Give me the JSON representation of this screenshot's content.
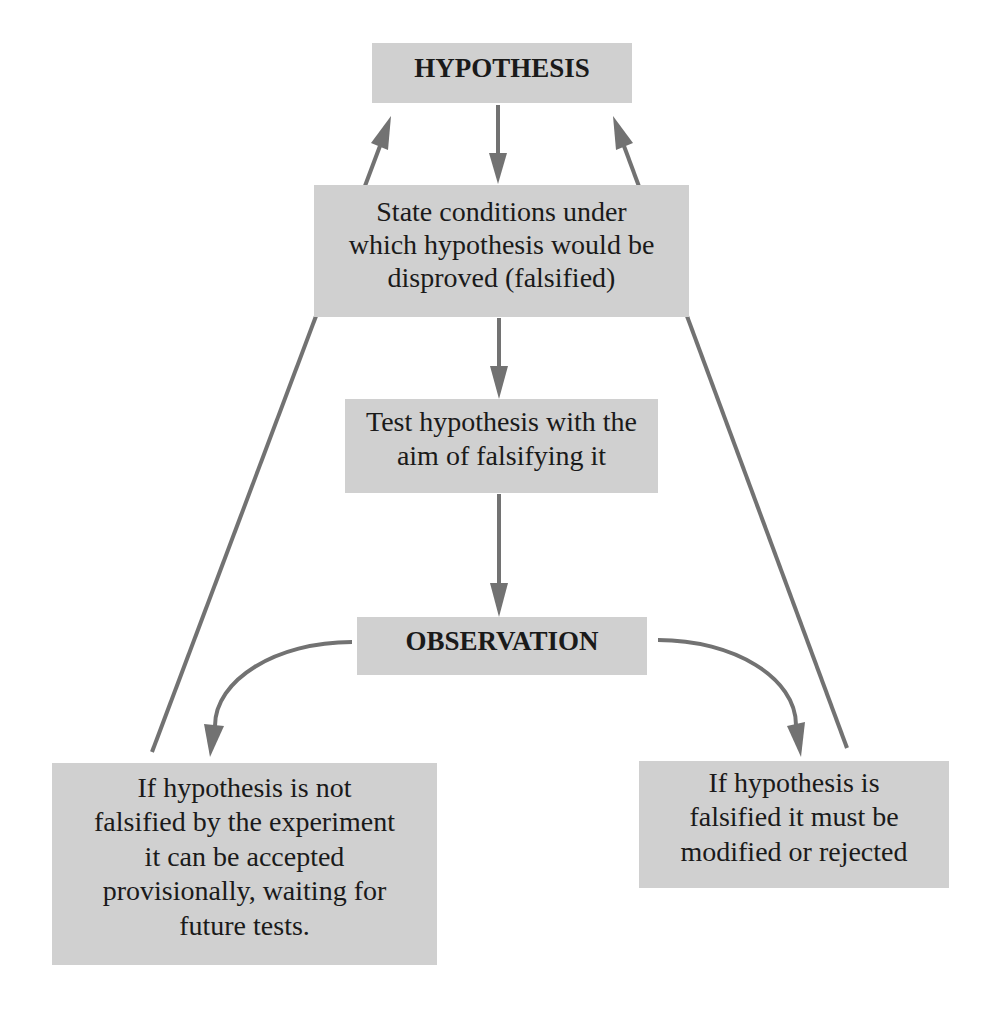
{
  "colors": {
    "box_fill": "#d0d0d0",
    "arrow": "#727272",
    "text": "#1a1a1a",
    "background": "#ffffff"
  },
  "nodes": {
    "hypothesis": {
      "label": "HYPOTHESIS"
    },
    "state_conditions": {
      "lines": [
        "State conditions under",
        "which hypothesis would be",
        "disproved (falsified)"
      ]
    },
    "test": {
      "lines": [
        "Test hypothesis with the",
        "aim of falsifying it"
      ]
    },
    "observation": {
      "label": "OBSERVATION"
    },
    "not_falsified": {
      "lines": [
        "If hypothesis is not",
        "falsified by the experiment",
        "it can be accepted",
        "provisionally, waiting for",
        "future tests."
      ]
    },
    "falsified": {
      "lines": [
        "If hypothesis is",
        "falsified it must be",
        "modified or rejected"
      ]
    }
  },
  "edges": [
    {
      "from": "hypothesis",
      "to": "state_conditions"
    },
    {
      "from": "state_conditions",
      "to": "test"
    },
    {
      "from": "test",
      "to": "observation"
    },
    {
      "from": "observation",
      "to": "not_falsified"
    },
    {
      "from": "observation",
      "to": "falsified"
    },
    {
      "from": "not_falsified",
      "to": "hypothesis"
    },
    {
      "from": "falsified",
      "to": "hypothesis"
    }
  ]
}
